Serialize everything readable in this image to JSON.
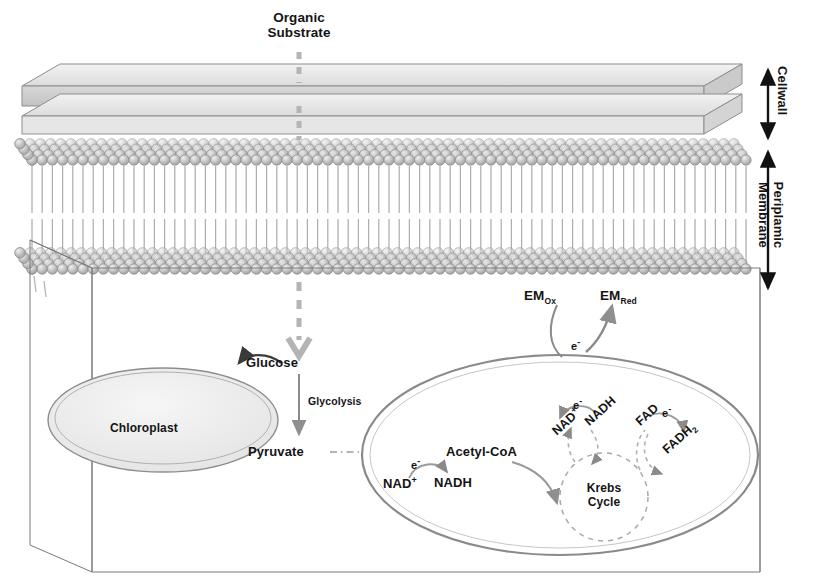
{
  "diagram": {
    "title_top": {
      "line1": "Organic",
      "line2": "Substrate"
    },
    "right_labels": [
      {
        "name": "cellwall",
        "text": "Cellwall"
      },
      {
        "name": "periplamic-membrane",
        "text": "Periplamic\nMembrane"
      }
    ],
    "organelles": {
      "chloroplast": "Chloroplast",
      "krebs_line1": "Krebs",
      "krebs_line2": "Cycle"
    },
    "metabolites": {
      "glucose": "Glucose",
      "glycolysis": "Glycolysis",
      "pyruvate": "Pyruvate",
      "acetyl_coa": "Acetyl-CoA",
      "nad_plus_cyto_base": "NAD",
      "nad_plus_cyto_sup": "+",
      "nadh_cyto": "NADH",
      "nad_plus_mito_base": "NAD",
      "nad_plus_mito_sup": "+",
      "nadh_mito": "NADH",
      "fad": "FAD",
      "fadh2_base": "FADH",
      "fadh2_sub": "2",
      "em_ox_base": "EM",
      "em_ox_sub": "Ox",
      "em_red_base": "EM",
      "em_red_sub": "Red"
    },
    "electrons": {
      "e_label_base": "e",
      "e_label_sup": "-"
    },
    "colors": {
      "ink": "#141414",
      "outline": "#6f6f6f",
      "arrow_gray": "#9a9a9a",
      "wall_fill_top": "#e8e8e8",
      "wall_fill_side": "#d2d2d2",
      "membrane_head": "#b9b9b9",
      "organelle_fill": "#ededed"
    }
  }
}
